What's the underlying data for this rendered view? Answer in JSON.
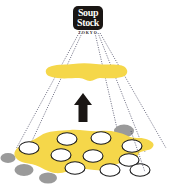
{
  "figure": {
    "type": "conceptual-diagram",
    "background_color": "#ffffff",
    "width": 176,
    "height": 190
  },
  "brand": {
    "logo_name": "soup-stock-tokyo-logo",
    "line1": "Soup",
    "line2": "Stock",
    "subtitle": "TOKYO",
    "badge_color": "#1a1614",
    "text_color": "#fdfcf8",
    "subtitle_color": "#2b2623"
  },
  "colors": {
    "yellow": "#f5d74a",
    "yellow_light": "#f7de63",
    "gray": "#9a9a9a",
    "outline": "#1a1a1a",
    "white": "#ffffff",
    "projection_line": "#3a3a55"
  },
  "elements": {
    "arrow": {
      "name": "upward-arrow",
      "direction": "up",
      "color": "#1a1614"
    },
    "upper_region": {
      "name": "upper-yellow-band",
      "label": "",
      "fill": "#f5d74a"
    },
    "lower_region": {
      "name": "lower-yellow-map",
      "label": "",
      "fill": "#f5d74a",
      "white_marker_count": 10,
      "gray_marker_count": 4
    },
    "projection_lines": {
      "name": "projection-lines",
      "count": 5,
      "style": "dotted"
    }
  }
}
